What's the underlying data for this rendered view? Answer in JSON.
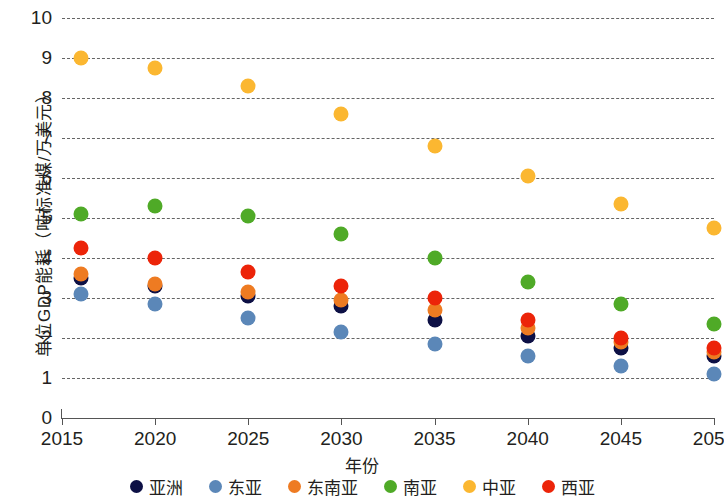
{
  "chart_data": {
    "type": "scatter",
    "title": "",
    "xlabel": "年份",
    "ylabel": "单位GDP能耗（吨标准煤/万美元）",
    "x": [
      2016,
      2020,
      2025,
      2030,
      2035,
      2040,
      2045,
      2050
    ],
    "xtick_labels": [
      "2015",
      "2020",
      "2025",
      "2030",
      "2035",
      "2040",
      "2045",
      "2050"
    ],
    "xlim": [
      2015,
      2050
    ],
    "ylim": [
      0,
      10
    ],
    "ytick_labels": [
      "0",
      "1",
      "2",
      "3",
      "4",
      "5",
      "6",
      "7",
      "8",
      "9",
      "10"
    ],
    "grid": "horizontal-dashed",
    "legend_position": "bottom",
    "series": [
      {
        "name": "亚洲",
        "color": "#0d1045",
        "values": [
          3.5,
          3.3,
          3.05,
          2.8,
          2.45,
          2.05,
          1.75,
          1.55
        ]
      },
      {
        "name": "东亚",
        "color": "#5b87b8",
        "values": [
          3.1,
          2.85,
          2.5,
          2.15,
          1.85,
          1.55,
          1.3,
          1.1
        ]
      },
      {
        "name": "东南亚",
        "color": "#ee7b22",
        "values": [
          3.6,
          3.35,
          3.15,
          2.95,
          2.7,
          2.25,
          1.9,
          1.65
        ]
      },
      {
        "name": "南亚",
        "color": "#4faa27",
        "values": [
          5.1,
          5.3,
          5.05,
          4.6,
          4.0,
          3.4,
          2.85,
          2.35
        ]
      },
      {
        "name": "中亚",
        "color": "#fbb731",
        "values": [
          9.0,
          8.75,
          8.3,
          7.6,
          6.8,
          6.05,
          5.35,
          4.75
        ]
      },
      {
        "name": "西亚",
        "color": "#ec2409",
        "values": [
          4.25,
          4.0,
          3.65,
          3.3,
          3.0,
          2.45,
          2.0,
          1.75
        ]
      }
    ]
  }
}
